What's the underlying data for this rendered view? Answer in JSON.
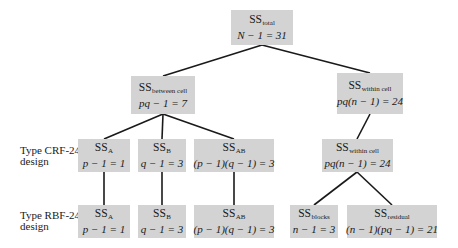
{
  "diagram": {
    "nodes": {
      "total": {
        "ss": "SS",
        "sub": "total",
        "df": "N − 1 = 31"
      },
      "between_cell": {
        "ss": "SS",
        "sub": "between cell",
        "df": "pq − 1 = 7"
      },
      "within_cell": {
        "ss": "SS",
        "sub": "within cell",
        "df": "pq(n − 1) = 24"
      },
      "crf_a": {
        "ss": "SS",
        "sub": "A",
        "df": "p − 1 = 1"
      },
      "crf_b": {
        "ss": "SS",
        "sub": "B",
        "df": "q − 1 = 3"
      },
      "crf_ab": {
        "ss": "SS",
        "sub": "AB",
        "df": "(p − 1)(q − 1) = 3"
      },
      "crf_within_cell": {
        "ss": "SS",
        "sub": "within cell",
        "df": "pq(n − 1) = 24"
      },
      "rbf_a": {
        "ss": "SS",
        "sub": "A",
        "df": "p − 1 = 1"
      },
      "rbf_b": {
        "ss": "SS",
        "sub": "B",
        "df": "q − 1 = 3"
      },
      "rbf_ab": {
        "ss": "SS",
        "sub": "AB",
        "df": "(p − 1)(q − 1) = 3"
      },
      "rbf_blocks": {
        "ss": "SS",
        "sub": "blocks",
        "df": "n − 1 = 3"
      },
      "rbf_residual": {
        "ss": "SS",
        "sub": "residual",
        "df": "(n − 1)(pq − 1) = 21"
      }
    },
    "row_labels": {
      "crf": {
        "line1": "Type CRF-24",
        "line2": "design"
      },
      "rbf": {
        "line1": "Type RBF-24",
        "line2": "design"
      }
    },
    "colors": {
      "box": "#d3d3d3",
      "line": "#1a1a1a"
    }
  }
}
